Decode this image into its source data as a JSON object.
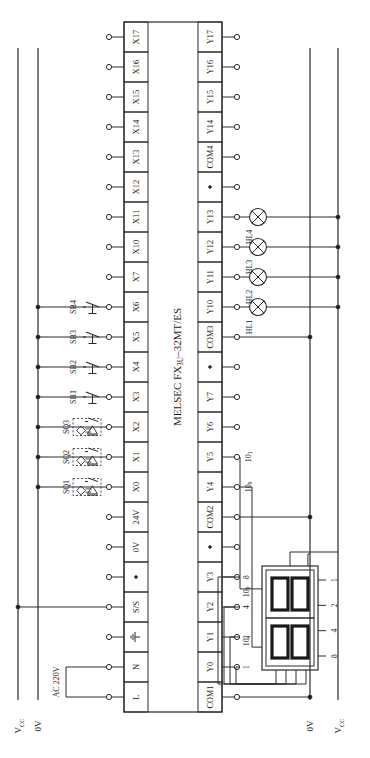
{
  "diagram": {
    "type": "plc-wiring-diagram",
    "orientation": "rotated-90",
    "plc": {
      "label_main": "MELSEC FX",
      "label_sub": "3U",
      "label_tail": "–32MT/ES"
    },
    "power": {
      "ac_label": "AC 220V",
      "left_rail_vcc": "V",
      "left_rail_vcc_sub": "CC",
      "left_rail_0v": "0V",
      "right_rail_0v": "0V",
      "right_rail_vcc": "V",
      "right_rail_vcc_sub": "CC"
    },
    "input_terminals": [
      {
        "label": "X17",
        "device": ""
      },
      {
        "label": "X16",
        "device": ""
      },
      {
        "label": "X15",
        "device": ""
      },
      {
        "label": "X14",
        "device": ""
      },
      {
        "label": "X13",
        "device": ""
      },
      {
        "label": "X12",
        "device": ""
      },
      {
        "label": "X11",
        "device": ""
      },
      {
        "label": "X10",
        "device": ""
      },
      {
        "label": "X7",
        "device": ""
      },
      {
        "label": "X6",
        "device": "SB4"
      },
      {
        "label": "X5",
        "device": "SB3"
      },
      {
        "label": "X4",
        "device": "SB2"
      },
      {
        "label": "X3",
        "device": "SB1"
      },
      {
        "label": "X2",
        "device": "SQ3"
      },
      {
        "label": "X1",
        "device": "SQ2"
      },
      {
        "label": "X0",
        "device": "SQ1"
      },
      {
        "label": "24V",
        "device": ""
      },
      {
        "label": "0V",
        "device": ""
      },
      {
        "label": "•",
        "device": ""
      },
      {
        "label": "S/S",
        "device": ""
      },
      {
        "label": "⏚",
        "device": ""
      },
      {
        "label": "N",
        "device": ""
      },
      {
        "label": "L",
        "device": ""
      }
    ],
    "output_terminals": [
      {
        "label": "Y17",
        "device": ""
      },
      {
        "label": "Y16",
        "device": ""
      },
      {
        "label": "Y15",
        "device": ""
      },
      {
        "label": "Y14",
        "device": ""
      },
      {
        "label": "COM4",
        "device": ""
      },
      {
        "label": "•",
        "device": ""
      },
      {
        "label": "Y13",
        "device": "HL4"
      },
      {
        "label": "Y12",
        "device": "HL3"
      },
      {
        "label": "Y11",
        "device": "HL2"
      },
      {
        "label": "Y10",
        "device": "HL1"
      },
      {
        "label": "COM3",
        "device": ""
      },
      {
        "label": "•",
        "device": ""
      },
      {
        "label": "Y7",
        "device": ""
      },
      {
        "label": "Y6",
        "device": ""
      },
      {
        "label": "Y5",
        "device": "10¹"
      },
      {
        "label": "Y4",
        "device": "10⁰"
      },
      {
        "label": "COM2",
        "device": ""
      },
      {
        "label": "•",
        "device": ""
      },
      {
        "label": "Y3",
        "device": "8"
      },
      {
        "label": "Y2",
        "device": "4"
      },
      {
        "label": "Y1",
        "device": "2"
      },
      {
        "label": "Y0",
        "device": "1"
      },
      {
        "label": "COM1",
        "device": ""
      }
    ],
    "pushbuttons": [
      "SB1",
      "SB2",
      "SB3",
      "SB4"
    ],
    "sensors": [
      "SQ1",
      "SQ2",
      "SQ3"
    ],
    "lamps": [
      "HL1",
      "HL2",
      "HL3",
      "HL4"
    ],
    "display": {
      "digit_high_label": "10¹",
      "digit_low_label": "10⁰",
      "bcd_weights": [
        "1",
        "2",
        "4",
        "8"
      ],
      "digits": 2
    }
  }
}
